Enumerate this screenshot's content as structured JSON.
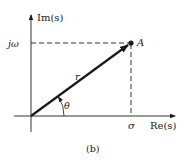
{
  "diagram": {
    "caption": "(b)",
    "axes": {
      "x_label": "Re(s)",
      "y_label": "Im(s)"
    },
    "point": {
      "label": "A"
    },
    "vector": {
      "magnitude_label": "r",
      "angle_label": "θ"
    },
    "projections": {
      "real_label": "σ",
      "imag_label": "jω"
    },
    "colors": {
      "line": "#1a1a1a",
      "background": "#ffffff"
    }
  }
}
